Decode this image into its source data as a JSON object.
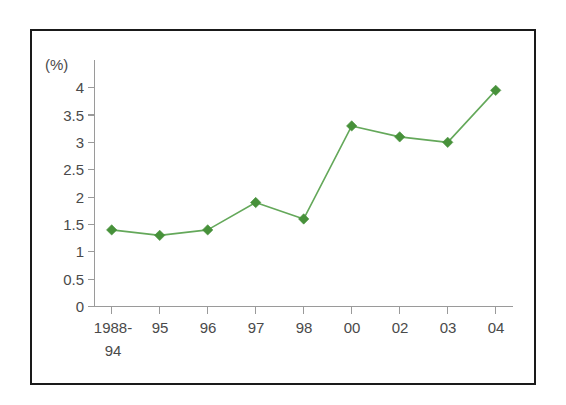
{
  "chart_data": {
    "type": "line",
    "title": "",
    "subtitle": "",
    "unit_label": "(%)",
    "xlabel": "",
    "ylabel": "",
    "ylim": [
      0,
      4
    ],
    "grid": false,
    "legend": "none",
    "categories": [
      "1988-\n94",
      "95",
      "96",
      "97",
      "98",
      "00",
      "02",
      "03",
      "04"
    ],
    "category_lines": [
      [
        "1988-",
        "94"
      ],
      [
        "95"
      ],
      [
        "96"
      ],
      [
        "97"
      ],
      [
        "98"
      ],
      [
        "00"
      ],
      [
        "02"
      ],
      [
        "03"
      ],
      [
        "04"
      ]
    ],
    "values": [
      1.4,
      1.3,
      1.4,
      1.9,
      1.6,
      3.3,
      3.1,
      3.0,
      3.95
    ],
    "y_ticks": [
      "0",
      "0.5",
      "1",
      "1.5",
      "2",
      "2.5",
      "3",
      "3.5",
      "4"
    ],
    "y_tick_values": [
      0,
      0.5,
      1,
      1.5,
      2,
      2.5,
      3,
      3.5,
      4
    ],
    "series": [
      {
        "name": "series-1",
        "values": [
          1.4,
          1.3,
          1.4,
          1.9,
          1.6,
          3.3,
          3.1,
          3.0,
          3.95
        ],
        "color": "#4d9641",
        "marker": "diamond"
      }
    ],
    "colors": {
      "line": "#64a85a",
      "marker": "#47913a",
      "axis": "#9a9a9a",
      "text": "#4a4a4a",
      "frame": "#1a1a1a",
      "background": "#ffffff"
    }
  }
}
